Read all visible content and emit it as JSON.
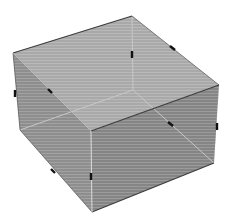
{
  "diagram": {
    "title": "Transparent rectangular box (cuboid) with edge tick marks",
    "colors": {
      "background": "#ffffff",
      "top_face": "#a9a9a9",
      "left_face": "#8e8e8e",
      "front_face": "#858585",
      "edge": "#3c3c3c",
      "hidden_edge": "#c8c8c8",
      "tick": "#111111"
    },
    "vertices": {
      "top_back": [
        132,
        16
      ],
      "top_left": [
        13,
        53
      ],
      "top_right": [
        219,
        85
      ],
      "top_front": [
        91,
        131
      ],
      "bottom_back": [
        133,
        90
      ],
      "bottom_left": [
        20,
        130
      ],
      "bottom_right": [
        214,
        163
      ],
      "bottom_front": [
        92,
        212
      ]
    },
    "ticks": [
      {
        "name": "tick-top-back-edge",
        "x1": 132,
        "y1": 51,
        "x2": 132,
        "y2": 58
      },
      {
        "name": "tick-top-right-edge",
        "x1": 170,
        "y1": 46,
        "x2": 175,
        "y2": 50
      },
      {
        "name": "tick-left-edge",
        "x1": 15,
        "y1": 90,
        "x2": 15,
        "y2": 97
      },
      {
        "name": "tick-top-left-edge",
        "x1": 48,
        "y1": 89,
        "x2": 52,
        "y2": 93
      },
      {
        "name": "tick-hidden-right-edge",
        "x1": 168,
        "y1": 122,
        "x2": 173,
        "y2": 126
      },
      {
        "name": "tick-right-vertical-edge",
        "x1": 217,
        "y1": 123,
        "x2": 217,
        "y2": 130
      },
      {
        "name": "tick-bottom-left-edge",
        "x1": 51,
        "y1": 169,
        "x2": 55,
        "y2": 173
      },
      {
        "name": "tick-front-vertical-edge",
        "x1": 91,
        "y1": 173,
        "x2": 91,
        "y2": 180
      }
    ]
  }
}
